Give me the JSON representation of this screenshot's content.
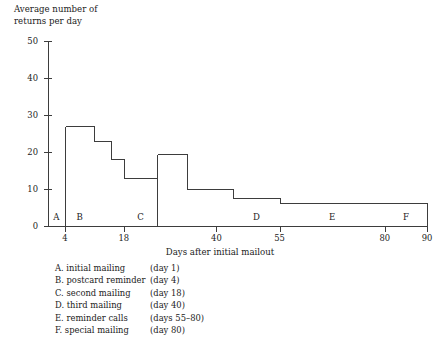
{
  "chart_data": {
    "type": "bar",
    "title": "Average number of returns per day",
    "ylabel": "Average number of\nreturns per day",
    "xlabel": "Days after initial mailout",
    "ylim": [
      0,
      50
    ],
    "xlim": [
      0,
      90
    ],
    "grid": false,
    "legend_position": "below-axis",
    "yticks": [
      0,
      10,
      20,
      30,
      40,
      50
    ],
    "ytick_labels": [
      "0",
      "10",
      "20",
      "30",
      "40",
      "50"
    ],
    "xticks": [
      4,
      18,
      40,
      55,
      80,
      90
    ],
    "xtick_labels": [
      "4",
      "18",
      "40",
      "55",
      "80",
      "90"
    ],
    "bins": [
      {
        "x0": 0,
        "x1": 4,
        "value": 0,
        "phase": "A"
      },
      {
        "x0": 4,
        "x1": 11,
        "value": 27,
        "phase": "B"
      },
      {
        "x0": 11,
        "x1": 15,
        "value": 23,
        "phase": ""
      },
      {
        "x0": 15,
        "x1": 18,
        "value": 18,
        "phase": ""
      },
      {
        "x0": 18,
        "x1": 26,
        "value": 13,
        "phase": "C"
      },
      {
        "x0": 26,
        "x1": 33,
        "value": 19.5,
        "phase": ""
      },
      {
        "x0": 33,
        "x1": 44,
        "value": 10,
        "phase": ""
      },
      {
        "x0": 44,
        "x1": 55,
        "value": 7.5,
        "phase": "D"
      },
      {
        "x0": 55,
        "x1": 80,
        "value": 6.3,
        "phase": "E"
      },
      {
        "x0": 80,
        "x1": 90,
        "value": 6.3,
        "phase": "F"
      }
    ],
    "phase_labels": [
      {
        "key": "A",
        "x": 2
      },
      {
        "key": "B",
        "x": 7.5
      },
      {
        "key": "C",
        "x": 22
      },
      {
        "key": "D",
        "x": 49.5
      },
      {
        "key": "E",
        "x": 67.5
      },
      {
        "key": "F",
        "x": 85
      }
    ],
    "series_color": "#3d3d3d",
    "axis_color": "#3d3d3d"
  },
  "legend": {
    "entries": [
      {
        "name": "A. initial mailing",
        "day": "(day 1)"
      },
      {
        "name": "B. postcard reminder",
        "day": "(day 4)"
      },
      {
        "name": "C. second mailing",
        "day": "(day 18)"
      },
      {
        "name": "D. third mailing",
        "day": "(day 40)"
      },
      {
        "name": "E. reminder calls",
        "day": "(days 55–80)"
      },
      {
        "name": "F. special mailing",
        "day": "(day 80)"
      }
    ]
  }
}
